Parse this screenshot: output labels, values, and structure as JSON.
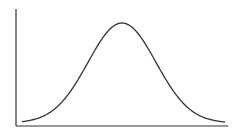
{
  "chart_data": {
    "type": "line",
    "title": "",
    "xlabel": "",
    "ylabel": "",
    "grid": false,
    "legend": null,
    "x_ticks": [],
    "y_ticks": [],
    "series": [
      {
        "name": "bell-curve",
        "color": "#333333",
        "shape": "gaussian",
        "mean_px_x": 122,
        "peak_px_y": 23,
        "baseline_px_y": 123,
        "sigma_px": 34,
        "start_px_x": 22,
        "end_px_x": 225
      }
    ],
    "axes": {
      "color": "#333333",
      "origin_px": [
        16,
        126
      ],
      "y_top_px": 9,
      "x_right_px": 228
    }
  }
}
